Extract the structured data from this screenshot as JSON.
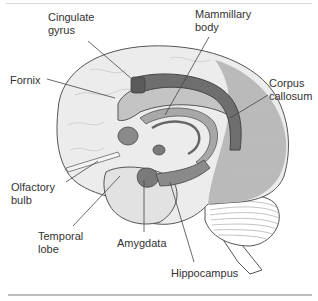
{
  "figure": {
    "colors": {
      "cortex_light": "#ededed",
      "cortex_dark": "#b8b8b8",
      "limbic_dark": "#6e6e6e",
      "limbic_mid": "#8a8a8a",
      "limbic_light": "#c4c4c4",
      "outline": "#555555",
      "leader_line": "#444444",
      "label_text": "#333333"
    },
    "labels": {
      "cingulate_gyrus": "Cingulate\ngyrus",
      "mammillary_body": "Mammillary\nbody",
      "fornix": "Fornix",
      "corpus_callosum": "Corpus\ncallosum",
      "olfactory_bulb": "Olfactory\nbulb",
      "temporal_lobe": "Temporal\nlobe",
      "amygdata": "Amygdata",
      "hippocampus": "Hippocampus"
    }
  }
}
